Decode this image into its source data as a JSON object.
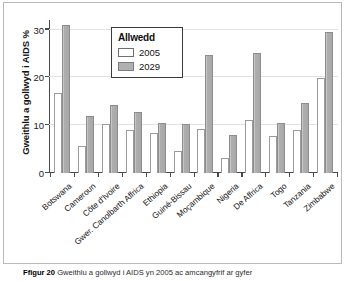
{
  "figure": {
    "caption_label": "Ffigur 20",
    "caption_text": "Gweithlu a gollwyd i AIDS yn 2005 ac amcangyfrif ar gyfer"
  },
  "legend": {
    "title": "Allwedd",
    "items": [
      {
        "label": "2005",
        "swatch": "white-swatch-icon",
        "color": "#ffffff"
      },
      {
        "label": "2029",
        "swatch": "gray-swatch-icon",
        "color": "#b0b0b0"
      }
    ]
  },
  "chart_data": {
    "type": "bar",
    "title": "",
    "xlabel": "",
    "ylabel": "Gweithlu a gollwyd i AIDS %",
    "ylim": [
      0,
      32
    ],
    "yticks": [
      0,
      10,
      20,
      30
    ],
    "ytick_labels": [
      "0",
      "10",
      "20",
      "30"
    ],
    "grid": true,
    "legend_position": "top-center-inside",
    "categories": [
      "Botswana",
      "Cameroun",
      "Côte d'Ivoire",
      "Gwer. Canolbarth Affrica",
      "Ethiopia",
      "Guiné-Bissau",
      "Moçambique",
      "Nigeria",
      "De Affrica",
      "Togo",
      "Tanzania",
      "Zimbabwe"
    ],
    "series": [
      {
        "name": "2005",
        "color": "#ffffff",
        "values": [
          16.8,
          5.7,
          10.3,
          9.0,
          8.4,
          4.6,
          9.3,
          3.2,
          11.0,
          7.8,
          9.0,
          19.9
        ]
      },
      {
        "name": "2029",
        "color": "#b0b0b0",
        "values": [
          31.0,
          12.0,
          14.2,
          12.7,
          10.4,
          10.2,
          24.7,
          7.9,
          25.0,
          10.5,
          14.6,
          29.4
        ]
      }
    ]
  }
}
